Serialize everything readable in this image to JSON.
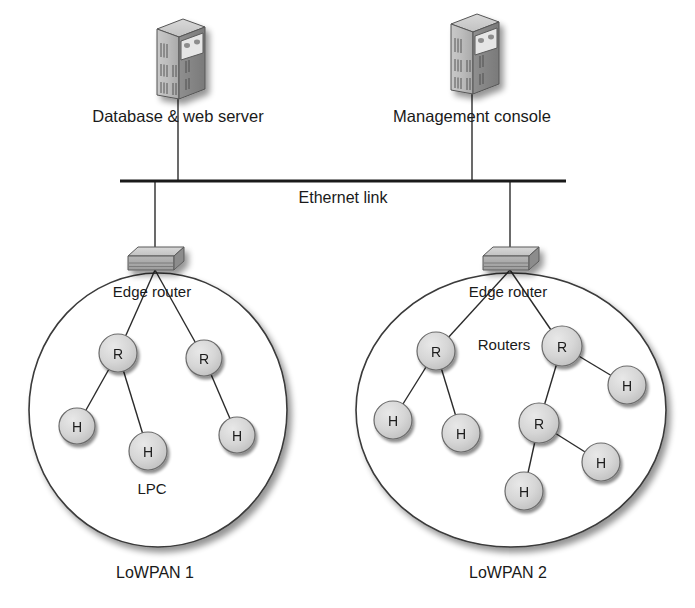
{
  "figure": {
    "background_color": "#ffffff",
    "line_color": "#2b2b2b",
    "node_fill": "#d4d4d4",
    "node_stroke": "#6b6b6b",
    "ellipse_stroke": "#3a3a3a"
  },
  "devices": [
    {
      "id": "database-web-server",
      "icon": "server-tower-icon",
      "label": "Database & web server",
      "x": 178,
      "y": 65,
      "label_x": 178,
      "label_y": 122
    },
    {
      "id": "management-console",
      "icon": "server-tower-icon",
      "label": "Management console",
      "x": 472,
      "y": 60,
      "label_x": 472,
      "label_y": 122
    }
  ],
  "backbone": {
    "label": "Ethernet link",
    "label_x": 343,
    "label_y": 203,
    "y": 181,
    "x_start": 120,
    "x_end": 566
  },
  "edge_routers": [
    {
      "id": "edge-router-1",
      "icon": "router-slab-icon",
      "label": "Edge router",
      "x": 155,
      "y": 262,
      "label_x": 152,
      "label_y": 297
    },
    {
      "id": "edge-router-2",
      "icon": "router-slab-icon",
      "label": "Edge router",
      "x": 510,
      "y": 262,
      "label_x": 508,
      "label_y": 297
    }
  ],
  "pans": [
    {
      "id": "lowpan-1",
      "label": "LoWPAN 1",
      "label_x": 155,
      "label_y": 578,
      "ellipse": {
        "cx": 158,
        "cy": 410,
        "rx": 129,
        "ry": 137
      },
      "annotations": [
        {
          "id": "lpc-annotation",
          "text": "LPC",
          "x": 152,
          "y": 494
        }
      ],
      "nodes": [
        {
          "id": "l-r1",
          "type": "R",
          "label": "R",
          "x": 118,
          "y": 353,
          "r": 19
        },
        {
          "id": "l-r2",
          "type": "R",
          "label": "R",
          "x": 204,
          "y": 358,
          "r": 18
        },
        {
          "id": "l-h1",
          "type": "H",
          "label": "H",
          "x": 77,
          "y": 426,
          "r": 18
        },
        {
          "id": "l-h2",
          "type": "H",
          "label": "H",
          "x": 148,
          "y": 451,
          "r": 19
        },
        {
          "id": "l-h3",
          "type": "H",
          "label": "H",
          "x": 237,
          "y": 435,
          "r": 18
        }
      ],
      "links": [
        {
          "from": "edge",
          "to": "l-r1"
        },
        {
          "from": "edge",
          "to": "l-r2"
        },
        {
          "from": "l-r1",
          "to": "l-h1"
        },
        {
          "from": "l-r1",
          "to": "l-h2"
        },
        {
          "from": "l-r2",
          "to": "l-h3"
        }
      ]
    },
    {
      "id": "lowpan-2",
      "label": "LoWPAN 2",
      "label_x": 508,
      "label_y": 578,
      "ellipse": {
        "cx": 511,
        "cy": 410,
        "rx": 155,
        "ry": 137
      },
      "annotations": [
        {
          "id": "routers-annotation",
          "text": "Routers",
          "x": 504,
          "y": 350
        }
      ],
      "nodes": [
        {
          "id": "r-r1",
          "type": "R",
          "label": "R",
          "x": 436,
          "y": 351,
          "r": 19
        },
        {
          "id": "r-r2",
          "type": "R",
          "label": "R",
          "x": 562,
          "y": 346,
          "r": 20
        },
        {
          "id": "r-h1",
          "type": "H",
          "label": "H",
          "x": 393,
          "y": 420,
          "r": 19
        },
        {
          "id": "r-h2",
          "type": "H",
          "label": "H",
          "x": 461,
          "y": 433,
          "r": 19
        },
        {
          "id": "r-h3",
          "type": "H",
          "label": "H",
          "x": 627,
          "y": 385,
          "r": 19
        },
        {
          "id": "r-r3",
          "type": "R",
          "label": "R",
          "x": 539,
          "y": 423,
          "r": 20
        },
        {
          "id": "r-h4",
          "type": "H",
          "label": "H",
          "x": 524,
          "y": 491,
          "r": 19
        },
        {
          "id": "r-h5",
          "type": "H",
          "label": "H",
          "x": 601,
          "y": 462,
          "r": 19
        }
      ],
      "links": [
        {
          "from": "edge",
          "to": "r-r1"
        },
        {
          "from": "edge",
          "to": "r-r2"
        },
        {
          "from": "r-r1",
          "to": "r-h1"
        },
        {
          "from": "r-r1",
          "to": "r-h2"
        },
        {
          "from": "r-r2",
          "to": "r-h3"
        },
        {
          "from": "r-r2",
          "to": "r-r3"
        },
        {
          "from": "r-r3",
          "to": "r-h4"
        },
        {
          "from": "r-r3",
          "to": "r-h5"
        }
      ]
    }
  ],
  "legend_keys": {
    "router_letter": "R",
    "host_letter": "H"
  }
}
